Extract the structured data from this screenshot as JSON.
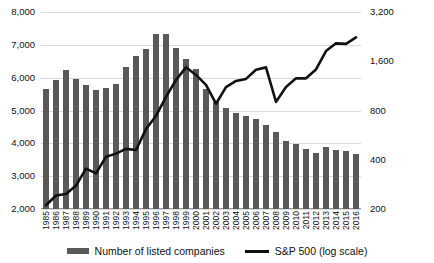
{
  "chart_data": {
    "type": "bar",
    "title": "",
    "subtitle": "",
    "xlabel": "",
    "ylabel": "",
    "categories": [
      "1985",
      "1986",
      "1987",
      "1988",
      "1989",
      "1990",
      "1991",
      "1992",
      "1993",
      "1994",
      "1995",
      "1996",
      "1997",
      "1998",
      "1999",
      "2000",
      "2001",
      "2002",
      "2003",
      "2004",
      "2005",
      "2006",
      "2007",
      "2008",
      "2009",
      "2010",
      "2011",
      "2012",
      "2013",
      "2014",
      "2015",
      "2016"
    ],
    "series": [
      {
        "name": "Number of listed companies",
        "type": "bar",
        "axis": "left",
        "color": "#595959",
        "values": [
          5650,
          5920,
          6220,
          5950,
          5780,
          5640,
          5690,
          5810,
          6330,
          6650,
          6870,
          7320,
          7320,
          6890,
          6560,
          6250,
          5650,
          5270,
          5080,
          4910,
          4820,
          4740,
          4550,
          4350,
          4070,
          3970,
          3820,
          3720,
          3890,
          3790,
          3770,
          3670
        ]
      },
      {
        "name": "S&P 500 (log scale)",
        "type": "line",
        "axis": "right",
        "color": "#111111",
        "values": [
          211,
          242,
          247,
          278,
          353,
          330,
          417,
          436,
          466,
          459,
          616,
          741,
          970,
          1229,
          1469,
          1320,
          1148,
          880,
          1112,
          1212,
          1248,
          1418,
          1468,
          903,
          1115,
          1258,
          1258,
          1426,
          1848,
          2059,
          2044,
          2239
        ]
      }
    ],
    "axes": {
      "left": {
        "ticks": [
          "2,000",
          "3,000",
          "4,000",
          "5,000",
          "6,000",
          "7,000",
          "8,000"
        ],
        "tick_values": [
          2000,
          3000,
          4000,
          5000,
          6000,
          7000,
          8000
        ],
        "min": 2000,
        "max": 8000,
        "scale": "linear"
      },
      "right": {
        "ticks": [
          "200",
          "400",
          "800",
          "1,600",
          "3,200"
        ],
        "tick_values": [
          200,
          400,
          800,
          1600,
          3200
        ],
        "min": 200,
        "max": 3200,
        "scale": "log"
      }
    },
    "grid": true,
    "legend_position": "bottom"
  },
  "legend": {
    "bars_label": "Number of listed companies",
    "line_label": "S&P 500 (log scale)",
    "bars_color": "#595959",
    "line_color": "#111111"
  }
}
